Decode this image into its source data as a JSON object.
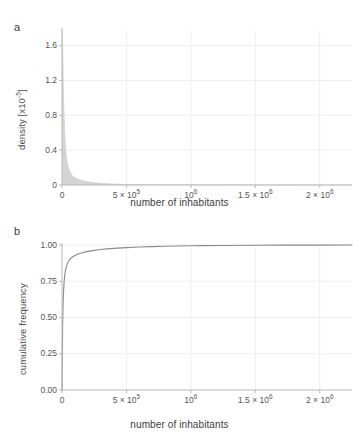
{
  "figure": {
    "panels": [
      {
        "label": "a",
        "ylabel": "density [x10",
        "ylabel_sup": "-5",
        "ylabel_tail": "]",
        "xlabel": "number of inhabitants",
        "yticks": [
          "0",
          "0.4",
          "0.8",
          "1.2",
          "1.6"
        ],
        "xticks": [
          "0",
          "5 × 10",
          "10",
          "1.5 × 10",
          "2 × 10"
        ],
        "xtick_sups": [
          "",
          "5",
          "6",
          "6",
          "6"
        ]
      },
      {
        "label": "b",
        "ylabel": "cumulative frequency",
        "xlabel": "number of inhabitants",
        "yticks": [
          "0.00",
          "0.25",
          "0.50",
          "0.75",
          "1.00"
        ],
        "xticks": [
          "0",
          "5 × 10",
          "10",
          "1.5 × 10",
          "2 × 10"
        ],
        "xtick_sups": [
          "",
          "5",
          "6",
          "6",
          "6"
        ]
      }
    ],
    "colors": {
      "histogram_fill": "#d4d4d4",
      "cdf_line": "#8a8a8a",
      "gridline": "#eceef0",
      "axis": "#b8b8b8",
      "text": "#4d4d4d"
    }
  },
  "chart_data": [
    {
      "type": "area",
      "title": "",
      "panel": "a",
      "xlabel": "number of inhabitants",
      "ylabel": "density [x10^-5]",
      "xlim": [
        0,
        2250000
      ],
      "ylim": [
        0,
        1.78
      ],
      "ytick_values": [
        0,
        0.4,
        0.8,
        1.2,
        1.6
      ],
      "xtick_values": [
        0,
        500000,
        1000000,
        1500000,
        2000000
      ],
      "grid": true,
      "legend": "none",
      "note": "density values in units of 1e-5; sharp spike at small population decaying with long right tail",
      "x": [
        0,
        5000,
        10000,
        15000,
        20000,
        25000,
        30000,
        35000,
        40000,
        50000,
        60000,
        70000,
        80000,
        90000,
        100000,
        120000,
        140000,
        160000,
        180000,
        200000,
        230000,
        260000,
        300000,
        350000,
        400000,
        450000,
        500000,
        600000,
        700000,
        800000,
        1000000,
        1200000,
        1500000,
        1800000,
        2100000,
        2250000
      ],
      "values": [
        1.78,
        1.62,
        1.15,
        0.84,
        0.63,
        0.49,
        0.39,
        0.32,
        0.27,
        0.2,
        0.16,
        0.13,
        0.11,
        0.095,
        0.085,
        0.07,
        0.058,
        0.05,
        0.043,
        0.037,
        0.03,
        0.025,
        0.019,
        0.014,
        0.011,
        0.009,
        0.007,
        0.005,
        0.004,
        0.003,
        0.002,
        0.0015,
        0.001,
        0.0007,
        0.0005,
        0.0004
      ]
    },
    {
      "type": "line",
      "title": "",
      "panel": "b",
      "xlabel": "number of inhabitants",
      "ylabel": "cumulative frequency",
      "xlim": [
        0,
        2250000
      ],
      "ylim": [
        0,
        1.0
      ],
      "ytick_values": [
        0.0,
        0.25,
        0.5,
        0.75,
        1.0
      ],
      "xtick_values": [
        0,
        500000,
        1000000,
        1500000,
        2000000
      ],
      "grid": true,
      "legend": "none",
      "x": [
        0,
        2000,
        5000,
        8000,
        12000,
        16000,
        20000,
        25000,
        30000,
        40000,
        50000,
        60000,
        80000,
        100000,
        125000,
        150000,
        175000,
        200000,
        250000,
        300000,
        350000,
        400000,
        500000,
        600000,
        700000,
        800000,
        900000,
        1000000,
        1100000,
        1250000,
        1500000,
        1750000,
        2000000,
        2250000
      ],
      "values": [
        0.0,
        0.2,
        0.44,
        0.58,
        0.68,
        0.74,
        0.78,
        0.815,
        0.838,
        0.868,
        0.887,
        0.9,
        0.917,
        0.928,
        0.938,
        0.945,
        0.951,
        0.956,
        0.963,
        0.969,
        0.973,
        0.977,
        0.982,
        0.986,
        0.989,
        0.991,
        0.993,
        0.9945,
        0.9955,
        0.9965,
        0.998,
        0.9988,
        0.9994,
        1.0
      ]
    }
  ]
}
